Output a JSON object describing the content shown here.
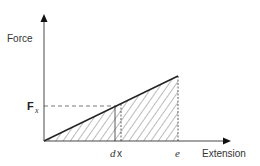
{
  "diagram": {
    "y_axis_label": "Force",
    "x_axis_label": "Extension",
    "force_marker": {
      "main": "F",
      "subscript": "x"
    },
    "dx_label": {
      "d": "d",
      "x": "x"
    },
    "e_label": "e",
    "line_color": "#222222",
    "hatch_color": "#555555",
    "dash_color": "#555555"
  }
}
